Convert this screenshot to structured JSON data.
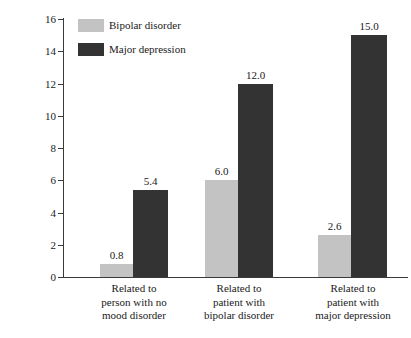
{
  "chart_data": {
    "type": "bar",
    "title": "",
    "xlabel": "",
    "ylabel": "Lifetime risk for 1st-degree relatives (percent)",
    "ylim": [
      0,
      16
    ],
    "yticks": [
      "0",
      "2",
      "4",
      "6",
      "8",
      "10",
      "12",
      "14",
      "16"
    ],
    "grid": false,
    "legend_position": "top-left",
    "categories": [
      "Related to person with no mood disorder",
      "Related to patient with bipolar disorder",
      "Related to patient with major depression"
    ],
    "category_lines": [
      [
        "Related to",
        "person with no",
        "mood disorder"
      ],
      [
        "Related to",
        "patient with",
        "bipolar disorder"
      ],
      [
        "Related to",
        "patient with",
        "major depression"
      ]
    ],
    "series": [
      {
        "name": "Bipolar disorder",
        "color": "#c3c3c3",
        "values": [
          0.8,
          6.0,
          2.6
        ],
        "labels": [
          "0.8",
          "6.0",
          "2.6"
        ]
      },
      {
        "name": "Major depression",
        "color": "#333333",
        "values": [
          5.4,
          12.0,
          15.0
        ],
        "labels": [
          "5.4",
          "12.0",
          "15.0"
        ]
      }
    ]
  },
  "legend": {
    "items": [
      {
        "label": "Bipolar disorder",
        "color": "#c3c3c3"
      },
      {
        "label": "Major depression",
        "color": "#333333"
      }
    ]
  },
  "axis": {
    "y_title": "Lifetime risk for 1st-degree relatives (percent)"
  }
}
